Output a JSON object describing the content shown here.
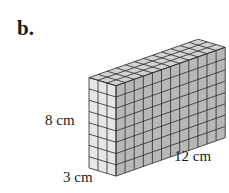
{
  "figure": {
    "part_label": "b.",
    "shape": "rectangular prism built from unit cubes",
    "dimensions": {
      "height_label": "8 cm",
      "length_label": "12 cm",
      "width_label": "3 cm",
      "height": 8,
      "length": 12,
      "width": 3
    },
    "colors": {
      "front_face": "#e6e6e6",
      "side_face": "#b8b8b8",
      "top_face": "#d2d2d2",
      "grid_line": "#2a2a2a"
    }
  }
}
